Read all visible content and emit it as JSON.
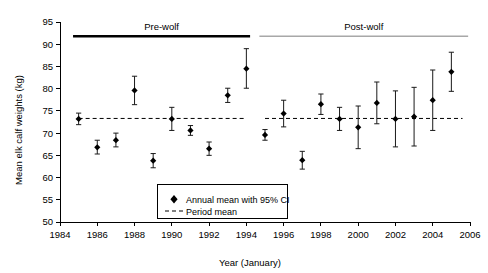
{
  "chart_data": {
    "type": "scatter",
    "title": "",
    "xlabel": "Year (January)",
    "ylabel": "Mean elk calf weights (kg)",
    "xlim": [
      1984,
      2006
    ],
    "ylim": [
      50,
      95
    ],
    "xticks": [
      1984,
      1986,
      1988,
      1990,
      1992,
      1994,
      1996,
      1998,
      2000,
      2002,
      2004,
      2006
    ],
    "yticks": [
      50,
      55,
      60,
      65,
      70,
      75,
      80,
      85,
      90,
      95
    ],
    "grid": false,
    "legend_position": "inside-bottom-center",
    "series": [
      {
        "name": "Annual mean with 95% CI",
        "marker": "diamond",
        "x": [
          1985,
          1986,
          1987,
          1988,
          1989,
          1990,
          1991,
          1992,
          1993,
          1994,
          1995,
          1996,
          1997,
          1998,
          1999,
          2000,
          2001,
          2002,
          2003,
          2004,
          2005
        ],
        "y": [
          73.2,
          66.8,
          68.4,
          79.6,
          63.8,
          73.2,
          70.6,
          66.5,
          78.5,
          84.5,
          69.6,
          74.4,
          63.9,
          76.5,
          73.2,
          71.3,
          76.8,
          73.2,
          73.7,
          77.4,
          83.8
        ],
        "ci_low": [
          71.9,
          65.3,
          66.9,
          76.4,
          62.2,
          70.6,
          69.5,
          65.0,
          76.9,
          80.1,
          68.4,
          71.4,
          61.9,
          74.2,
          70.6,
          66.5,
          72.1,
          66.9,
          67.1,
          70.6,
          79.4
        ],
        "ci_high": [
          74.5,
          68.4,
          70.0,
          82.8,
          65.4,
          75.8,
          71.7,
          68.0,
          80.1,
          89.0,
          70.8,
          77.4,
          65.9,
          78.8,
          75.8,
          76.1,
          81.5,
          79.5,
          80.3,
          84.2,
          88.2
        ]
      }
    ],
    "reference_lines": [
      {
        "name": "Period mean (pre-wolf)",
        "label": "Period mean",
        "value": 73.3,
        "style": "dashed",
        "x_start": 1985,
        "x_end": 1994
      },
      {
        "name": "Period mean (post-wolf)",
        "label": "Period mean",
        "value": 73.3,
        "style": "dashed",
        "x_start": 1995,
        "x_end": 2005.6
      }
    ],
    "period_bars": [
      {
        "label": "Pre-wolf",
        "x_start": 1984.7,
        "x_end": 1994.2,
        "value": 91.8,
        "color": "#000000",
        "thickness": "thick"
      },
      {
        "label": "Post-wolf",
        "x_start": 1994.7,
        "x_end": 2005.9,
        "value": 91.8,
        "color": "#a8a8a8",
        "thickness": "thin"
      }
    ],
    "legend": [
      {
        "label": "Annual mean with 95% CI",
        "marker": "diamond"
      },
      {
        "label": "Period mean",
        "marker": "dashed-line"
      }
    ]
  },
  "axes": {
    "y_title": "Mean elk calf weights (kg)",
    "x_title": "Year (January)",
    "y_tick_labels": [
      "50",
      "55",
      "60",
      "65",
      "70",
      "75",
      "80",
      "85",
      "90",
      "95"
    ],
    "x_tick_labels": [
      "1984",
      "1986",
      "1988",
      "1990",
      "1992",
      "1994",
      "1996",
      "1998",
      "2000",
      "2002",
      "2004",
      "2006"
    ]
  },
  "annotations": {
    "pre_wolf_label": "Pre-wolf",
    "post_wolf_label": "Post-wolf"
  },
  "legend": {
    "item_annual": "Annual mean with 95% CI",
    "item_period": "Period mean"
  },
  "colors": {
    "marker": "#000000",
    "error_bar": "#1a1a1a",
    "pre_wolf_bar": "#000000",
    "post_wolf_bar": "#a8a8a8",
    "axis": "#000000",
    "background": "#ffffff"
  }
}
